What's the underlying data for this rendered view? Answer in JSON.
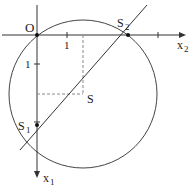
{
  "diagram": {
    "axes": {
      "x2": {
        "label": "x",
        "subscript": "2",
        "direction": "right"
      },
      "x1": {
        "label": "x",
        "subscript": "1",
        "direction": "down"
      },
      "origin_label": "O"
    },
    "ticks": {
      "x2_tick_label": "1",
      "x1_tick_label": "1"
    },
    "points": {
      "S": {
        "label": "S"
      },
      "S1": {
        "label": "S",
        "subscript": "1"
      },
      "S2": {
        "label": "S",
        "subscript": "2"
      }
    },
    "colors": {
      "stroke": "#333333",
      "dashed": "#888888",
      "background": "#ffffff"
    }
  }
}
